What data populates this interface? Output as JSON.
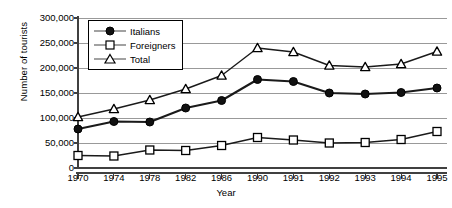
{
  "chart_data": {
    "type": "line",
    "title": "",
    "xlabel": "Year",
    "ylabel": "Number of tourists",
    "categories": [
      "1970",
      "1974",
      "1978",
      "1982",
      "1986",
      "1990",
      "1991",
      "1992",
      "1993",
      "1994",
      "1995"
    ],
    "ylim": [
      0,
      300000
    ],
    "ytick_values": [
      0,
      50000,
      100000,
      150000,
      200000,
      250000,
      300000
    ],
    "ytick_labels": [
      "0",
      "50,000",
      "100,000",
      "150,000",
      "200,000",
      "250,000",
      "300,000"
    ],
    "grid": true,
    "legend_position": "top-left",
    "series": [
      {
        "name": "Italians",
        "marker": "filled-circle",
        "color": "#000000",
        "values": [
          78000,
          93000,
          92000,
          120000,
          135000,
          177000,
          173000,
          150000,
          148000,
          151000,
          160000
        ]
      },
      {
        "name": "Foreigners",
        "marker": "open-square",
        "color": "#000000",
        "values": [
          25000,
          24000,
          36000,
          35000,
          45000,
          61000,
          56000,
          50000,
          51000,
          57000,
          73000
        ]
      },
      {
        "name": "Total",
        "marker": "open-triangle",
        "color": "#000000",
        "values": [
          102000,
          118000,
          136000,
          158000,
          185000,
          240000,
          232000,
          205000,
          202000,
          208000,
          233000
        ]
      }
    ]
  },
  "legend": {
    "items": [
      {
        "label": "Italians"
      },
      {
        "label": "Foreigners"
      },
      {
        "label": "Total"
      }
    ]
  },
  "colors": {
    "axis": "#404040",
    "grid": "#999999",
    "line": "#1a1a1a",
    "background": "#ffffff"
  }
}
